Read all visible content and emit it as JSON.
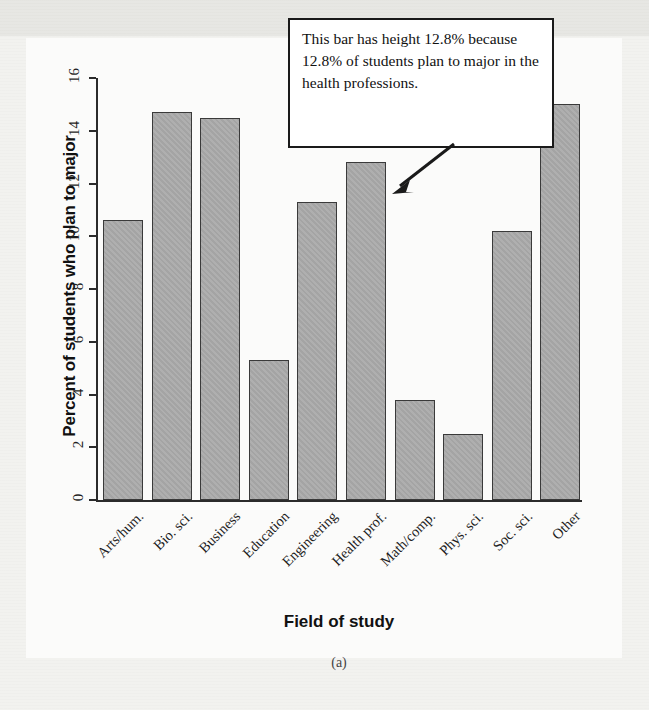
{
  "figure": {
    "caption": "(a)",
    "annotation": {
      "text": "This bar has height 12.8% because 12.8% of students plan to major in the health professions.",
      "points_to_category": "Health prof.",
      "arrow_icon": "arrow-down-left-icon"
    },
    "colors": {
      "bar_fill": "#a9a9a9",
      "bar_stroke": "#3a3a3a",
      "axis": "#2b2b2b",
      "page_background": "#f2f2ef",
      "callout_background": "#ffffff",
      "callout_border": "#1a1a1a"
    }
  },
  "chart_data": {
    "type": "bar",
    "title": "",
    "xlabel": "Field of study",
    "ylabel": "Percent of students who plan to major",
    "categories": [
      "Arts/hum.",
      "Bio. sci.",
      "Business",
      "Education",
      "Engineering",
      "Health prof.",
      "Math/comp.",
      "Phys. sci.",
      "Soc. sci.",
      "Other"
    ],
    "values": [
      10.6,
      14.7,
      14.5,
      5.3,
      11.3,
      12.8,
      3.8,
      2.5,
      10.2,
      15.0
    ],
    "ylim": [
      0,
      16
    ],
    "yticks": [
      0,
      2,
      4,
      6,
      8,
      10,
      12,
      14,
      16
    ],
    "ytick_labels": [
      "0",
      "2",
      "4",
      "6",
      "8",
      "10",
      "12",
      "14",
      "16"
    ],
    "grid": false,
    "legend": null
  }
}
